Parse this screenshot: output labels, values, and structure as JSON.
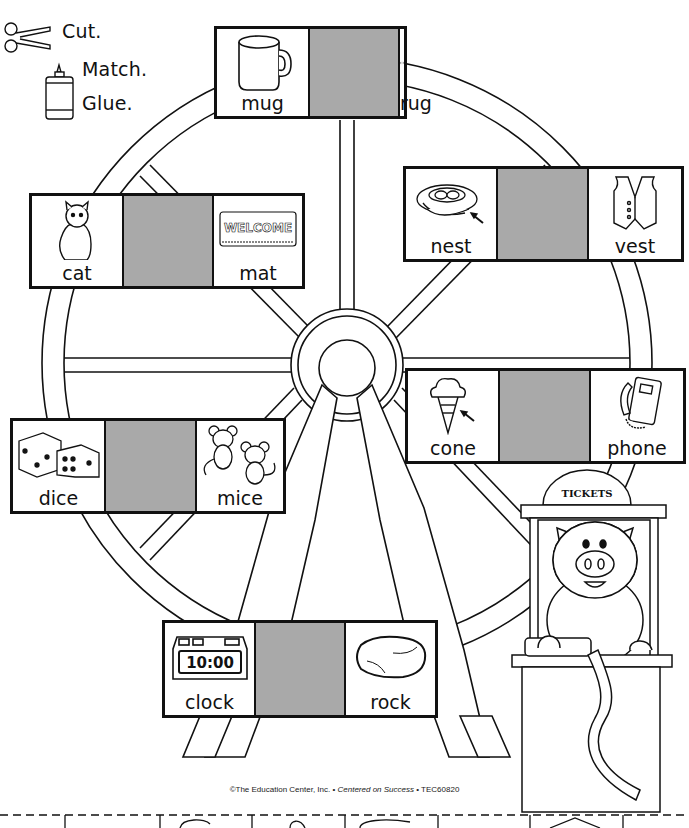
{
  "instructions": {
    "cut": "Cut.",
    "match": "Match.",
    "glue": "Glue."
  },
  "title_fragment": "rhyming rides",
  "cards": [
    {
      "id": "top",
      "left": {
        "word": "mug",
        "icon": "mug-icon"
      },
      "right": {
        "word": "rug",
        "icon": "rug-icon"
      }
    },
    {
      "id": "upper-left",
      "left": {
        "word": "cat",
        "icon": "cat-icon"
      },
      "right": {
        "word": "mat",
        "icon": "welcome-mat-icon",
        "mat_text": "WELCOME"
      }
    },
    {
      "id": "upper-right",
      "left": {
        "word": "nest",
        "icon": "nest-icon"
      },
      "right": {
        "word": "vest",
        "icon": "vest-icon"
      }
    },
    {
      "id": "middle-right",
      "left": {
        "word": "cone",
        "icon": "ice-cream-cone-icon"
      },
      "right": {
        "word": "phone",
        "icon": "phone-icon"
      }
    },
    {
      "id": "middle-left",
      "left": {
        "word": "dice",
        "icon": "dice-icon"
      },
      "right": {
        "word": "mice",
        "icon": "mice-icon"
      }
    },
    {
      "id": "bottom",
      "left": {
        "word": "clock",
        "icon": "clock-icon",
        "clock_text": "10:00"
      },
      "right": {
        "word": "rock",
        "icon": "rock-icon"
      }
    }
  ],
  "booth": {
    "sign": "TICKETS",
    "character": "pig"
  },
  "footer": {
    "publisher": "©The Education Center, Inc. • ",
    "slogan": "Centered on Success",
    "code": " • TEC60820"
  },
  "colors": {
    "line": "#111111",
    "blank_cell": "#a9a9a9",
    "background": "#ffffff"
  }
}
